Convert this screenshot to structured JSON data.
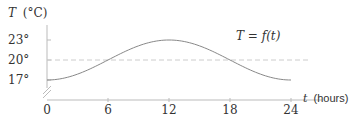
{
  "chart_data": {
    "type": "line",
    "title": "",
    "xlabel_var": "t",
    "xlabel_unit": "(hours)",
    "ylabel_var": "T",
    "ylabel_unit": "(°C)",
    "curve_label": "T = f(t)",
    "x_ticks": [
      0,
      6,
      12,
      18,
      24
    ],
    "x_tick_labels": [
      "0",
      "6",
      "12",
      "18",
      "24"
    ],
    "y_ticks": [
      17,
      20,
      23
    ],
    "y_tick_labels": [
      "17°",
      "20°",
      "23°"
    ],
    "xlim": [
      0,
      24
    ],
    "ylim_visible": [
      17,
      23
    ],
    "reference_line": {
      "y": 20,
      "style": "dashed"
    },
    "axis_break": true,
    "series": [
      {
        "name": "T = f(t)",
        "function": "20 - 3*cos(2*pi*t/24)",
        "x": [
          0,
          2,
          4,
          6,
          8,
          10,
          12,
          14,
          16,
          18,
          20,
          22,
          24
        ],
        "y": [
          17.0,
          17.4,
          18.5,
          20.0,
          21.5,
          22.6,
          23.0,
          22.6,
          21.5,
          20.0,
          18.5,
          17.4,
          17.0
        ]
      }
    ],
    "colors": {
      "axis": "#bbbbbb",
      "curve": "#888888",
      "dashed": "#cccccc",
      "text": "#333333"
    }
  }
}
